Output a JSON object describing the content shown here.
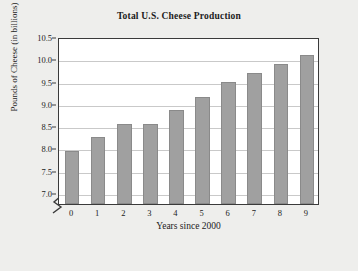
{
  "chart_data": {
    "type": "bar",
    "title": "Total U.S. Cheese Production",
    "xlabel": "Years since 2000",
    "ylabel": "Pounds of Cheese (in billions)",
    "categories": [
      "0",
      "1",
      "2",
      "3",
      "4",
      "5",
      "6",
      "7",
      "8",
      "9"
    ],
    "values": [
      7.95,
      8.25,
      8.55,
      8.55,
      8.85,
      9.15,
      9.5,
      9.7,
      9.9,
      10.1
    ],
    "ylim": [
      6.75,
      10.5
    ],
    "yticks": [
      "7.0",
      "7.5",
      "8.0",
      "8.5",
      "9.0",
      "9.5",
      "10.0",
      "10.5"
    ],
    "ytick_values": [
      7.0,
      7.5,
      8.0,
      8.5,
      9.0,
      9.5,
      10.0,
      10.5
    ],
    "grid": true,
    "legend": "none",
    "axis_break": true,
    "bar_color": "#a0a0a0",
    "bar_edge_color": "#8a8a8a",
    "grid_color": "#c9c9c9",
    "frame_color": "#3a3a3a",
    "plot_background": "#ffffff",
    "figure_background": "#eeeeec",
    "text_color": "#1b1b1b"
  }
}
